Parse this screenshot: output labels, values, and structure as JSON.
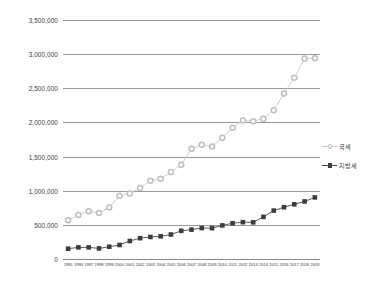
{
  "chart_data": {
    "type": "line",
    "title": "",
    "subtitle": "",
    "xlabel": "",
    "ylabel": "",
    "grid": true,
    "legend_position": "right",
    "ylim": [
      0,
      3500000
    ],
    "y_ticks": [
      "0",
      "500,000",
      "1,000,000",
      "1,500,000",
      "2,000,000",
      "2,500,000",
      "3,000,000",
      "3,500,000"
    ],
    "y_tick_values": [
      0,
      500000,
      1000000,
      1500000,
      2000000,
      2500000,
      3000000,
      3500000
    ],
    "categories": [
      "1995",
      "1996",
      "1997",
      "1998",
      "1999",
      "2000",
      "2001",
      "2002",
      "2003",
      "2004",
      "2005",
      "2006",
      "2007",
      "2008",
      "2009",
      "2010",
      "2011",
      "2012",
      "2013",
      "2014",
      "2015",
      "2016",
      "2017",
      "2018",
      "2019"
    ],
    "series": [
      {
        "name": "국세",
        "marker": "circle",
        "color": "#bfbfbf",
        "line_color": "#c9c9c9",
        "values": [
          567000,
          646000,
          699000,
          675000,
          754000,
          925000,
          959000,
          1039000,
          1146000,
          1177000,
          1274000,
          1380000,
          1614000,
          1674000,
          1646000,
          1776000,
          1923000,
          2030000,
          2019000,
          2055000,
          2177000,
          2425000,
          2653000,
          2938000,
          2939000
        ]
      },
      {
        "name": "지방세",
        "marker": "square",
        "color": "#3d3d3d",
        "line_color": "#4a4a4a",
        "values": [
          151000,
          170000,
          170000,
          155000,
          180000,
          205000,
          264000,
          305000,
          323000,
          332000,
          359000,
          413000,
          430000,
          453000,
          452000,
          492000,
          523000,
          539000,
          537000,
          617000,
          709000,
          758000,
          801000,
          843000,
          902000
        ]
      }
    ]
  },
  "legend": {
    "items": [
      {
        "label": "국세"
      },
      {
        "label": "지방세"
      }
    ]
  }
}
